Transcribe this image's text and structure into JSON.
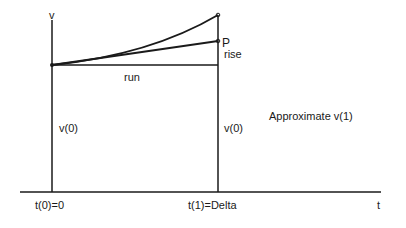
{
  "diagram": {
    "type": "euler-approximation",
    "axes": {
      "y_label": "v",
      "x_label": "t"
    },
    "labels": {
      "point": "P",
      "rise": "rise",
      "run": "run",
      "v0_left": "v(0)",
      "v0_right": "v(0)",
      "t0": "t(0)=0",
      "t1": "t(1)=Delta",
      "caption": "Approximate v(1)"
    },
    "colors": {
      "line": "#1a1a1a",
      "background": "#ffffff"
    }
  }
}
